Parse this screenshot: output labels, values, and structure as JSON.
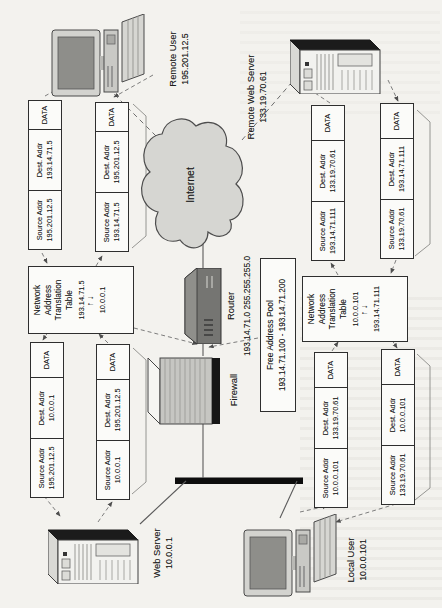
{
  "figure": {
    "internet": {
      "label": "Internet"
    },
    "router": {
      "label": "Router",
      "address": "193.14.71.0 255.255.255.0"
    },
    "firewall": {
      "label": "Firewall"
    },
    "free_pool": {
      "title": "Free Address Pool",
      "range": "193.14.71.100 - 193.14.71.200"
    },
    "nat_title": {
      "lines": [
        "Network",
        "Address",
        "Translation",
        "Table"
      ]
    },
    "nat1": {
      "top_ip": "193.14.71.5",
      "arrows": "↑↓",
      "bottom_ip": "10.0.0.1"
    },
    "nat2": {
      "top_ip": "10.0.0.101",
      "arrows": "↑↓",
      "bottom_ip": "193.14.71.111"
    },
    "devices": {
      "web_server": {
        "name": "Web Server",
        "ip": "10.0.0.1"
      },
      "local_user": {
        "name": "Local User",
        "ip": "10.0.0.101"
      },
      "remote_user": {
        "name": "Remote User",
        "ip": "195.201.12.5"
      },
      "remote_web_server": {
        "name": "Remote Web Server",
        "ip": "133.19.70.61"
      }
    },
    "packet_header": {
      "source": "Source Addr",
      "dest": "Dest. Addr",
      "data": "DATA"
    },
    "packets": {
      "a": {
        "src": "195.201.12.5",
        "dst": "10.0.0.1"
      },
      "b": {
        "src": "10.0.0.1",
        "dst": "195.201.12.5"
      },
      "c": {
        "src": "195.201.12.5",
        "dst": "193.14.71.5"
      },
      "d": {
        "src": "193.14.71.5",
        "dst": "195.201.12.5"
      },
      "e": {
        "src": "10.0.0.101",
        "dst": "133.19.70.61"
      },
      "f": {
        "src": "133.19.70.61",
        "dst": "10.0.0.101"
      },
      "g": {
        "src": "193.14.71.111",
        "dst": "133.19.70.61"
      },
      "h": {
        "src": "133.19.70.61",
        "dst": "193.14.71.111"
      }
    },
    "colors": {
      "paper": "#f3f2ee",
      "ink": "#1c1c1c",
      "backbone": "#0d0d0d",
      "cloud_fill": "#d6d6d2"
    }
  }
}
